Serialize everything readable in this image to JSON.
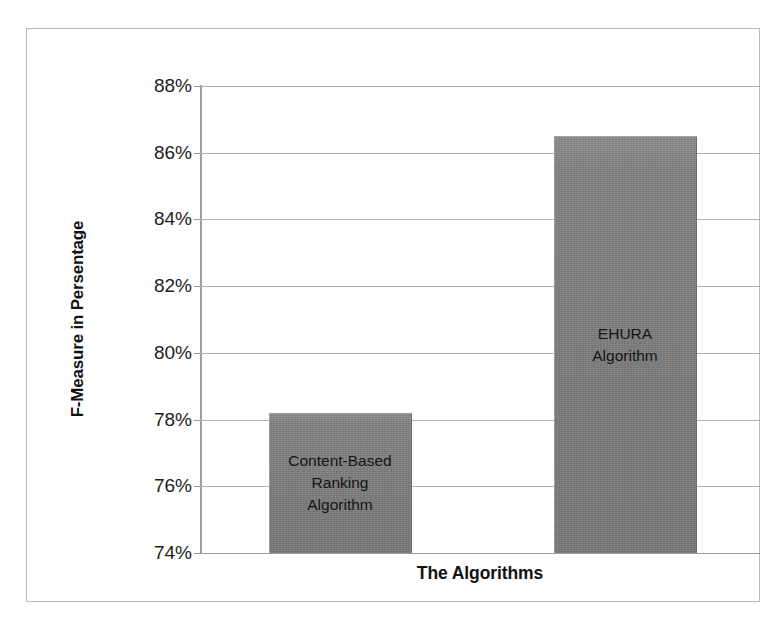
{
  "chart_data": {
    "type": "bar",
    "title": "",
    "xlabel": "The Algorithms",
    "ylabel": "F-Measure in Persentage",
    "categories": [
      "Content-Based\nRanking\nAlgorithm",
      "EHURA\nAlgorithm"
    ],
    "values": [
      78.2,
      86.5
    ],
    "ylim": [
      74,
      88
    ],
    "ytick_labels": [
      "88%",
      "86%",
      "84%",
      "82%",
      "80%",
      "78%",
      "76%",
      "74%"
    ],
    "ytick_values": [
      88,
      86,
      84,
      82,
      80,
      78,
      76,
      74
    ],
    "xtick_labels": [
      "",
      ""
    ],
    "grid": true,
    "legend": false,
    "legend_position": "none",
    "series": [
      {
        "name": "F-Measure",
        "values": [
          78.2,
          86.5
        ],
        "color": "#808080"
      }
    ],
    "annotations": [
      {
        "text": "Content-Based\nRanking\nAlgorithm",
        "target": "bar-1",
        "position": "inside"
      },
      {
        "text": "EHURA\nAlgorithm",
        "target": "bar-2",
        "position": "inside"
      }
    ],
    "colors": {
      "bar_fill": "#808080",
      "gridline": "#b0b0b0",
      "axis_line": "#9c9c9c",
      "frame_border": "#b9b9b9",
      "text": "#1a1a1a",
      "background": "#ffffff"
    }
  }
}
